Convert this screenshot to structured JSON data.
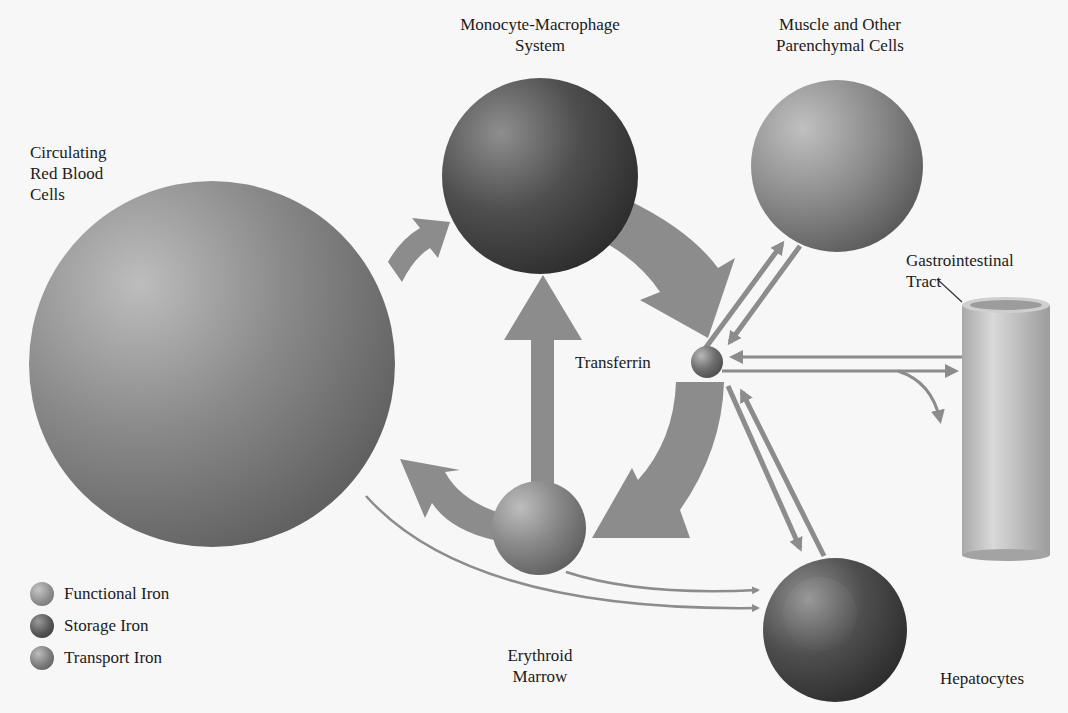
{
  "nodes": {
    "rbc": {
      "label": "Circulating\nRed Blood\nCells",
      "iron_type": "Functional Iron"
    },
    "mms": {
      "label": "Monocyte-Macrophage\nSystem",
      "iron_type": "Storage Iron"
    },
    "muscle": {
      "label": "Muscle and Other\nParenchymal Cells",
      "iron_type": "Functional Iron"
    },
    "gi": {
      "label": "Gastrointestinal\nTract"
    },
    "transferrin": {
      "label": "Transferrin",
      "iron_type": "Transport Iron"
    },
    "marrow": {
      "label": "Erythroid\nMarrow",
      "iron_type": "Functional Iron"
    },
    "hepatocytes": {
      "label": "Hepatocytes",
      "iron_type": "Storage Iron"
    }
  },
  "edges": [
    {
      "from": "Circulating Red Blood Cells",
      "to": "Monocyte-Macrophage System",
      "style": "thick"
    },
    {
      "from": "Monocyte-Macrophage System",
      "to": "Transferrin",
      "style": "thick"
    },
    {
      "from": "Erythroid Marrow",
      "to": "Monocyte-Macrophage System",
      "style": "thick"
    },
    {
      "from": "Erythroid Marrow",
      "to": "Circulating Red Blood Cells",
      "style": "thick"
    },
    {
      "from": "Transferrin",
      "to": "Erythroid Marrow",
      "style": "thick"
    },
    {
      "from": "Transferrin",
      "to": "Muscle and Other Parenchymal Cells",
      "style": "thin"
    },
    {
      "from": "Muscle and Other Parenchymal Cells",
      "to": "Transferrin",
      "style": "thin"
    },
    {
      "from": "Gastrointestinal Tract",
      "to": "Transferrin",
      "style": "thin"
    },
    {
      "from": "Transferrin",
      "to": "Gastrointestinal Tract",
      "style": "thin"
    },
    {
      "from": "Transferrin",
      "to": "Loss",
      "style": "thin"
    },
    {
      "from": "Transferrin",
      "to": "Hepatocytes",
      "style": "thin"
    },
    {
      "from": "Hepatocytes",
      "to": "Transferrin",
      "style": "thin"
    },
    {
      "from": "Circulating Red Blood Cells",
      "to": "Hepatocytes",
      "style": "line"
    },
    {
      "from": "Erythroid Marrow",
      "to": "Hepatocytes",
      "style": "line"
    }
  ],
  "legend": {
    "items": [
      {
        "label": "Functional Iron"
      },
      {
        "label": "Storage Iron"
      },
      {
        "label": "Transport Iron"
      }
    ]
  },
  "colors": {
    "background": "#f7f7f7",
    "arrow": "#8c8c8c",
    "text": "#1b1b1b"
  }
}
